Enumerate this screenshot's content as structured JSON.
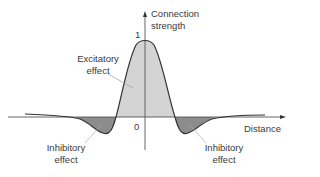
{
  "diagram": {
    "type": "mexican-hat connection profile",
    "y_axis_label_line1": "Connection",
    "y_axis_label_line2": "strength",
    "x_axis_label": "Distance",
    "tick_one": "1",
    "tick_zero": "0",
    "excitatory_line1": "Excitatory",
    "excitatory_line2": "effect",
    "inhibitory_left_line1": "Inhibitory",
    "inhibitory_left_line2": "effect",
    "inhibitory_right_line1": "Inhibitory",
    "inhibitory_right_line2": "effect",
    "colors": {
      "excitatory_fill": "#d4d4d4",
      "inhibitory_fill": "#8c8c8c",
      "stroke": "#333333",
      "text": "#3a3a3a"
    }
  }
}
